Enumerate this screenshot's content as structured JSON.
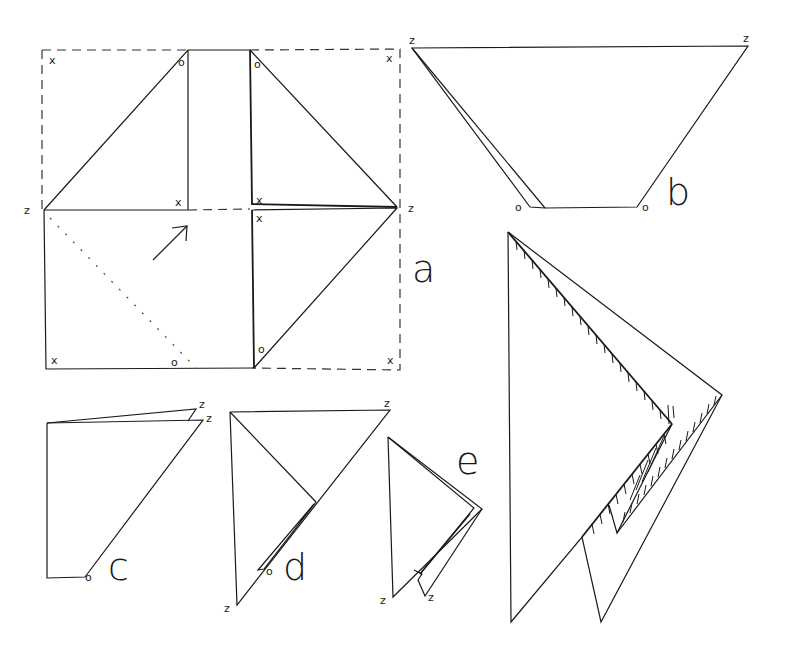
{
  "figure": {
    "panels": [
      {
        "id": "a",
        "label": "a",
        "description": "flat square with folded flaps, dashed original outline"
      },
      {
        "id": "b",
        "label": "b",
        "description": "trapezoid fold"
      },
      {
        "id": "c",
        "label": "c",
        "description": "quadrilateral fold"
      },
      {
        "id": "d",
        "label": "d",
        "description": "triangle with inner fold"
      },
      {
        "id": "e",
        "label": "e",
        "description": "small folded triangle"
      },
      {
        "id": "final",
        "label": "",
        "description": "large hatched folded model"
      }
    ],
    "marks": {
      "z": "z",
      "x": "x",
      "o": "o"
    },
    "arrow": {
      "direction": "up-right",
      "name": "fold-direction-arrow"
    }
  }
}
